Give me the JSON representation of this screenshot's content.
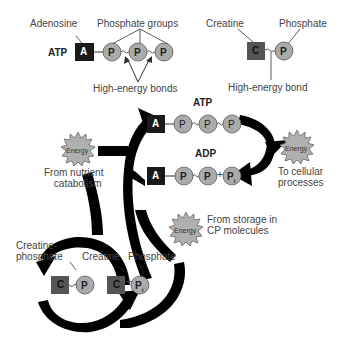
{
  "legend": {
    "atp_label": "ATP",
    "adenosine_label": "Adenosine",
    "phosphate_groups_label": "Phosphate groups",
    "high_energy_bonds_label": "High-energy bonds",
    "creatine_label": "Creatine",
    "phosphate_label": "Phosphate",
    "high_energy_bond_label": "High-energy bond"
  },
  "cycle": {
    "atp_label": "ATP",
    "adp_label": "ADP",
    "energy_word": "Energy",
    "from_nutrient_line1": "From nutrient",
    "from_nutrient_line2": "catabolism",
    "to_cellular_line1": "To cellular",
    "to_cellular_line2": "processes",
    "from_storage_line1": "From storage in",
    "from_storage_line2": "CP molecules",
    "creatine_phosphate_line1": "Creatine-",
    "creatine_phosphate_line2": "phosphate",
    "creatine_label": "Creatine",
    "phosphate_label": "Phosphate"
  },
  "glyphs": {
    "adenosine": "A",
    "phosphate": "P",
    "creatine": "C",
    "inorganic_phosphate": "P",
    "inorganic_sub": "i",
    "plus": "+"
  },
  "colors": {
    "adenosine_box": "#1a1a1a",
    "creatine_box": "#555555",
    "phosphate_circle": "#aaaaaa",
    "energy_burst": "#b0b0b0",
    "arrow": "#000000"
  }
}
